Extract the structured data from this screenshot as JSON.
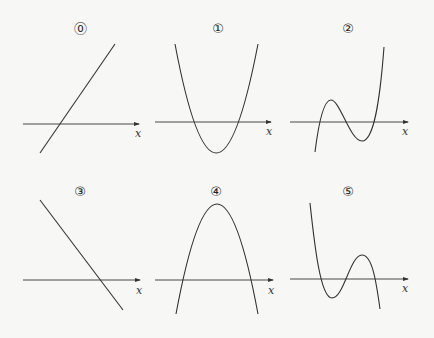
{
  "panels": [
    {
      "id": "0",
      "marker": "⓪",
      "axis_label": "x",
      "shape": "increasing line"
    },
    {
      "id": "1",
      "marker": "①",
      "axis_label": "x",
      "shape": "upward parabola, two roots"
    },
    {
      "id": "2",
      "marker": "②",
      "axis_label": "x",
      "shape": "cubic, positive leading coefficient, three roots"
    },
    {
      "id": "3",
      "marker": "③",
      "axis_label": "x",
      "shape": "decreasing line"
    },
    {
      "id": "4",
      "marker": "④",
      "axis_label": "x",
      "shape": "downward parabola, two roots"
    },
    {
      "id": "5",
      "marker": "⑤",
      "axis_label": "x",
      "shape": "cubic, negative leading coefficient, three roots"
    }
  ],
  "colors": {
    "background": "#f7f7f5",
    "ink": "#333333"
  }
}
